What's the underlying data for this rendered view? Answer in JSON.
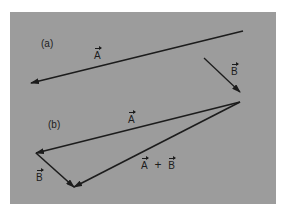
{
  "figure": {
    "background_color": "#9c9c9c",
    "line_color": "#1c1c1c",
    "part_a": {
      "label": "(a)",
      "vectors": [
        {
          "name": "A",
          "label": "A",
          "from": [
            243,
            31
          ],
          "to": [
            31,
            83
          ]
        },
        {
          "name": "B",
          "label": "B",
          "from": [
            204,
            58
          ],
          "to": [
            240,
            92
          ]
        }
      ]
    },
    "part_b": {
      "label": "(b)",
      "vectors": [
        {
          "name": "A",
          "label": "A",
          "from": [
            240,
            102
          ],
          "to": [
            36,
            153
          ]
        },
        {
          "name": "B",
          "label": "B",
          "from": [
            36,
            153
          ],
          "to": [
            74,
            187
          ]
        },
        {
          "name": "A+B",
          "label_left": "A",
          "operator": "+",
          "label_right": "B",
          "from": [
            240,
            102
          ],
          "to": [
            74,
            187
          ]
        }
      ]
    }
  }
}
